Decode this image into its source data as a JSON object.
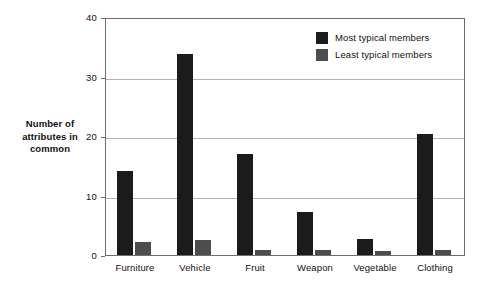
{
  "chart_data": {
    "type": "bar",
    "title": "",
    "xlabel": "",
    "ylabel": "Number of attributes in common",
    "ylabel_lines": [
      "Number of",
      "attributes in",
      "common"
    ],
    "categories": [
      "Furniture",
      "Vehicle",
      "Fruit",
      "Weapon",
      "Vegetable",
      "Clothing"
    ],
    "series": [
      {
        "name": "Most typical members",
        "color": "#1b1b1b",
        "values": [
          14.1,
          33.8,
          17.0,
          7.2,
          2.7,
          20.3
        ]
      },
      {
        "name": "Least typical members",
        "color": "#4d4d4d",
        "values": [
          2.2,
          2.5,
          0.8,
          0.9,
          0.6,
          0.8
        ]
      }
    ],
    "ylim": [
      0,
      40
    ],
    "yticks": [
      0,
      10,
      20,
      30,
      40
    ],
    "ytick_labels": [
      "0",
      "10",
      "20",
      "30",
      "40"
    ],
    "grid": true,
    "legend_position": "top-right"
  },
  "legend": {
    "entries": [
      {
        "label": "Most typical members",
        "color": "#1b1b1b"
      },
      {
        "label": "Least typical members",
        "color": "#4d4d4d"
      }
    ]
  },
  "colors": {
    "most_typical": "#1b1b1b",
    "least_typical": "#4d4d4d",
    "gridline": "#b4b4b4",
    "axis": "#6d6d6d",
    "background": "#ffffff",
    "text": "#111111"
  }
}
